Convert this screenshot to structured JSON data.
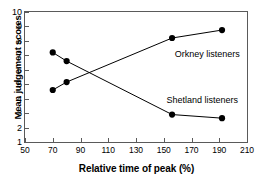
{
  "chart_data": {
    "type": "line",
    "title": "",
    "xlabel": "Relative time of peak (%)",
    "ylabel": "Mean judgement scores",
    "xlim": [
      50,
      210
    ],
    "ylim": [
      1,
      10
    ],
    "xticks": [
      50,
      70,
      90,
      110,
      130,
      150,
      170,
      190,
      210
    ],
    "yticks": [
      1,
      2,
      3,
      4,
      5,
      6,
      7,
      8,
      9,
      10
    ],
    "grid": false,
    "legend_position": "inline-annotations",
    "marker": "filled-circle",
    "series": [
      {
        "name": "Orkney listeners",
        "color": "#000000",
        "x": [
          70,
          80,
          156,
          192
        ],
        "y": [
          4.6,
          5.15,
          8.2,
          8.75
        ],
        "label_x": 158,
        "label_y": 7.0
      },
      {
        "name": "Shetland listeners",
        "color": "#000000",
        "x": [
          70,
          80,
          156,
          192
        ],
        "y": [
          7.2,
          6.6,
          2.9,
          2.65
        ],
        "label_x": 152,
        "label_y": 3.85
      }
    ]
  },
  "axis": {
    "y_title": "Mean judgement scores",
    "x_title": "Relative time of peak (%)",
    "y_tick_labels": [
      "1",
      "2",
      "3",
      "4",
      "5",
      "6",
      "7",
      "8",
      "9",
      "10"
    ],
    "x_tick_labels": [
      "50",
      "70",
      "90",
      "110",
      "130",
      "150",
      "170",
      "190",
      "210"
    ]
  },
  "annotations": {
    "orkney": "Orkney listeners",
    "shetland": "Shetland listeners"
  }
}
